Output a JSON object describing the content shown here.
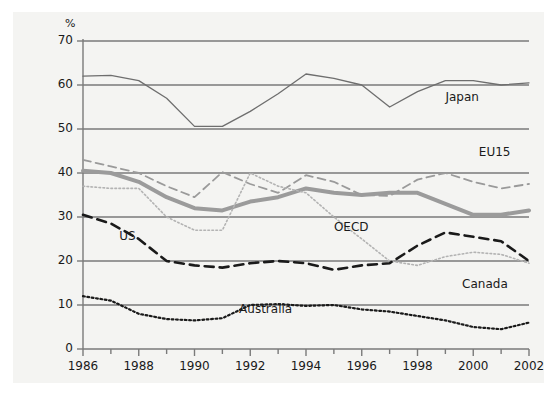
{
  "chart_data": {
    "type": "line",
    "title": "",
    "subtitle": "",
    "xlabel": "",
    "ylabel": "%",
    "ylim": [
      0,
      70
    ],
    "xlim": [
      1986,
      2002
    ],
    "ytick_labels": [
      "0",
      "10",
      "20",
      "30",
      "40",
      "50",
      "60",
      "70"
    ],
    "ytick_values": [
      0,
      10,
      20,
      30,
      40,
      50,
      60,
      70
    ],
    "xtick_labels": [
      "1986",
      "1988",
      "1990",
      "1992",
      "1994",
      "1996",
      "1998",
      "2000",
      "2002"
    ],
    "xtick_values": [
      1986,
      1988,
      1990,
      1992,
      1994,
      1996,
      1998,
      2000,
      2002
    ],
    "x": [
      1986,
      1987,
      1988,
      1989,
      1990,
      1991,
      1992,
      1993,
      1994,
      1995,
      1996,
      1997,
      1998,
      1999,
      2000,
      2001,
      2002
    ],
    "grid": "horizontal",
    "legend_position": "inline-labels",
    "series": [
      {
        "name": "Japan",
        "style": "solid",
        "color": "#6e6e6e",
        "label_x": 1999.0,
        "label_y": 57.0,
        "values": [
          62.0,
          62.2,
          61.0,
          57.0,
          50.6,
          50.6,
          54.0,
          58.0,
          62.5,
          61.5,
          60.0,
          55.0,
          58.5,
          61.0,
          61.0,
          60.0,
          60.5
        ]
      },
      {
        "name": "EU15",
        "style": "dashed",
        "color": "#9a9a9a",
        "label_x": 2000.2,
        "label_y": 44.5,
        "values": [
          43.0,
          41.5,
          40.0,
          37.0,
          34.5,
          40.2,
          37.5,
          35.5,
          39.5,
          38.0,
          35.0,
          34.8,
          38.5,
          40.0,
          38.0,
          36.5,
          37.5
        ]
      },
      {
        "name": "OECD",
        "style": "solid-thick",
        "color": "#9b9b9b",
        "label_x": 1995.0,
        "label_y": 27.5,
        "values": [
          40.5,
          40.0,
          38.0,
          34.5,
          32.0,
          31.5,
          33.5,
          34.5,
          36.5,
          35.5,
          35.0,
          35.5,
          35.5,
          33.0,
          30.5,
          30.5,
          31.5
        ]
      },
      {
        "name": "US",
        "style": "dotted",
        "color": "#b3b3b3",
        "label_x": 1987.3,
        "label_y": 25.5,
        "values": [
          37.0,
          36.5,
          36.5,
          30.0,
          27.0,
          27.0,
          40.0,
          37.0,
          35.5,
          30.0,
          25.0,
          20.0,
          19.0,
          21.0,
          22.0,
          21.5,
          19.5
        ]
      },
      {
        "name": "Canada",
        "style": "dashed-heavy",
        "color": "#1a1a1a",
        "label_x": 1999.6,
        "label_y": 14.5,
        "values": [
          30.5,
          28.5,
          25.0,
          20.0,
          19.0,
          18.5,
          19.5,
          20.0,
          19.5,
          18.0,
          19.0,
          19.5,
          23.5,
          26.5,
          25.5,
          24.5,
          20.0
        ]
      },
      {
        "name": "Australia",
        "style": "dotted-heavy",
        "color": "#1a1a1a",
        "label_x": 1991.6,
        "label_y": 8.8,
        "values": [
          12.0,
          11.0,
          8.0,
          6.8,
          6.5,
          7.0,
          10.0,
          10.2,
          9.8,
          10.0,
          9.0,
          8.5,
          7.5,
          6.5,
          5.0,
          4.5,
          6.0
        ]
      }
    ]
  }
}
